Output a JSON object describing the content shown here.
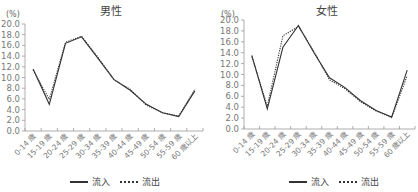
{
  "chart_data": [
    {
      "type": "line",
      "title": "男性",
      "ylabel": "(%)",
      "xlabel": "",
      "ylim": [
        0,
        20
      ],
      "yticks": [
        "0.0",
        "2.0",
        "4.0",
        "6.0",
        "8.0",
        "10.0",
        "12.0",
        "14.0",
        "16.0",
        "18.0",
        "20.0"
      ],
      "categories": [
        "0-14 歳",
        "15-19 歳",
        "20-24 歳",
        "25-29 歳",
        "30-34 歳",
        "35-39 歳",
        "40-44 歳",
        "45-49 歳",
        "50-54 歳",
        "55-59 歳",
        "60 歳以上"
      ],
      "series": [
        {
          "name": "流入",
          "style": "solid",
          "values": [
            11.6,
            5.0,
            16.4,
            17.6,
            13.6,
            9.6,
            7.6,
            5.0,
            3.4,
            2.7,
            7.5
          ]
        },
        {
          "name": "流出",
          "style": "dotted",
          "values": [
            11.4,
            5.9,
            16.6,
            17.7,
            13.8,
            9.6,
            7.8,
            4.8,
            3.4,
            2.8,
            7.8
          ]
        }
      ],
      "grid": false,
      "legend_position": "bottom"
    },
    {
      "type": "line",
      "title": "女性",
      "ylabel": "(%)",
      "xlabel": "",
      "ylim": [
        0,
        20
      ],
      "yticks": [
        "0.0",
        "2.0",
        "4.0",
        "6.0",
        "8.0",
        "10.0",
        "12.0",
        "14.0",
        "16.0",
        "18.0",
        "20.0"
      ],
      "categories": [
        "0-14 歳",
        "15-19 歳",
        "20-24 歳",
        "25-29 歳",
        "30-34 歳",
        "35-39 歳",
        "40-44 歳",
        "45-49 歳",
        "50-54 歳",
        "55-59 歳",
        "60 歳以上"
      ],
      "series": [
        {
          "name": "流入",
          "style": "solid",
          "values": [
            13.5,
            3.7,
            15.0,
            19.0,
            14.0,
            9.4,
            7.6,
            5.2,
            3.4,
            2.2,
            10.8
          ]
        },
        {
          "name": "流出",
          "style": "dotted",
          "values": [
            13.3,
            4.2,
            17.1,
            18.8,
            14.2,
            9.0,
            7.4,
            5.0,
            3.3,
            2.1,
            9.8
          ]
        }
      ],
      "grid": false,
      "legend_position": "bottom"
    }
  ],
  "panels": [
    {
      "title": "男性",
      "unit": "(%)",
      "legend": {
        "inflow": "流入",
        "outflow": "流出"
      }
    },
    {
      "title": "女性",
      "unit": "(%)",
      "legend": {
        "inflow": "流入",
        "outflow": "流出"
      }
    }
  ]
}
